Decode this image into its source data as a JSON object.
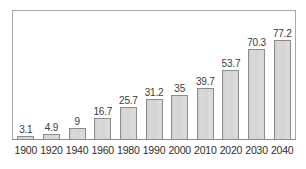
{
  "chart_data": {
    "type": "bar",
    "title": "",
    "subtitle": "",
    "xlabel": "",
    "ylabel": "",
    "categories": [
      "1900",
      "1920",
      "1940",
      "1960",
      "1980",
      "1990",
      "2000",
      "2010",
      "2020",
      "2030",
      "2040"
    ],
    "values": [
      3.1,
      4.9,
      9,
      16.7,
      25.7,
      31.2,
      35,
      39.7,
      53.7,
      70.3,
      77.2
    ],
    "value_labels": [
      "3.1",
      "4.9",
      "9",
      "16.7",
      "25.7",
      "31.2",
      "35",
      "39.7",
      "53.7",
      "70.3",
      "77.2"
    ],
    "ylim": [
      0,
      90
    ],
    "grid": false,
    "legend": null,
    "annotations": [],
    "colors": {
      "bar_fill": "#d6d6d6",
      "bar_border": "#8c8c8c",
      "frame": "#a8a8a8",
      "label_text": "#2d2d2d",
      "value_text": "#3a3a3a",
      "background": "#ffffff"
    }
  }
}
